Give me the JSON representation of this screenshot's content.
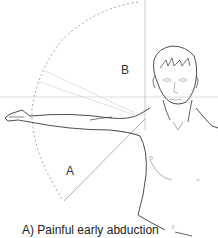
{
  "figure": {
    "caption": "A) Painful early abduction",
    "zone_labels": {
      "a": "A",
      "b": "B"
    },
    "colors": {
      "outline": "#3a3a3a",
      "guide": "#bdbdbd",
      "arc": "#9a9a9a",
      "ray": "#d8d8d8"
    }
  }
}
